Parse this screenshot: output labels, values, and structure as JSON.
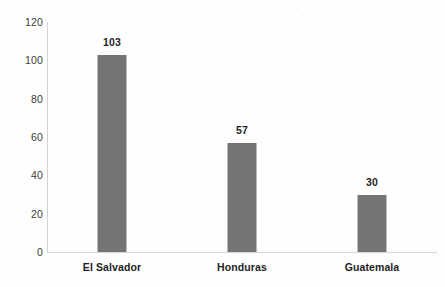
{
  "chart_data": {
    "type": "bar",
    "title": "",
    "subtitle": "",
    "xlabel": "",
    "ylabel": "",
    "categories": [
      "El Salvador",
      "Honduras",
      "Guatemala"
    ],
    "values": [
      103,
      57,
      30
    ],
    "data_labels": [
      "103",
      "57",
      "30"
    ],
    "ylim": [
      0,
      120
    ],
    "ytick_labels": [
      "0",
      "20",
      "40",
      "60",
      "80",
      "100",
      "120"
    ],
    "ytick_values": [
      0,
      20,
      40,
      60,
      80,
      100,
      120
    ],
    "grid": false,
    "legend": false,
    "legend_position": "none",
    "orientation": "vertical",
    "colors": {
      "bar": "#757575",
      "axis": "#d3d3d3",
      "tick_label": "#3b3b3b",
      "data_label": "#1f1f1f",
      "category_label": "#1f1f1f",
      "background": "#fefefe"
    }
  }
}
